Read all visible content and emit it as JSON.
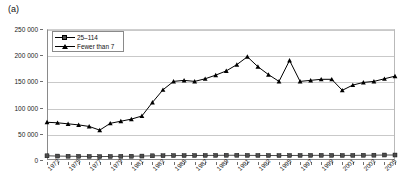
{
  "panel": {
    "label": "(a)"
  },
  "chart_data": {
    "type": "line",
    "title": "",
    "xlabel": "",
    "ylabel": "",
    "ylim": [
      0,
      250000
    ],
    "xlim": [
      1973,
      2006
    ],
    "grid": true,
    "legend_position": "top-left",
    "ytick_labels": [
      "0",
      "50 000",
      "100 000",
      "150 000",
      "200 000",
      "250 000"
    ],
    "ytick_values": [
      0,
      50000,
      100000,
      150000,
      200000,
      250000
    ],
    "x": [
      1973,
      1974,
      1975,
      1976,
      1977,
      1978,
      1979,
      1980,
      1981,
      1982,
      1983,
      1984,
      1985,
      1986,
      1987,
      1988,
      1989,
      1990,
      1991,
      1992,
      1993,
      1994,
      1995,
      1996,
      1997,
      1998,
      1999,
      2000,
      2001,
      2002,
      2003,
      2004,
      2005,
      2006
    ],
    "xtick_labels": [
      "1973",
      "1975",
      "1977",
      "1979",
      "1981",
      "1983",
      "1985",
      "1987",
      "1989",
      "1991",
      "1993",
      "1995",
      "1997",
      "1999",
      "2001",
      "2003",
      "2005"
    ],
    "xtick_values": [
      1973,
      1975,
      1977,
      1979,
      1981,
      1983,
      1985,
      1987,
      1989,
      1991,
      1993,
      1995,
      1997,
      1999,
      2001,
      2003,
      2005
    ],
    "series": [
      {
        "name": "25–114",
        "marker": "square",
        "color": "#4c4c4c",
        "values": [
          8000,
          7500,
          7200,
          7000,
          6800,
          6500,
          6800,
          7000,
          7200,
          7500,
          8000,
          8200,
          8500,
          8500,
          8600,
          8700,
          8800,
          9000,
          9000,
          8800,
          8700,
          8600,
          8500,
          8600,
          8700,
          8800,
          8900,
          8800,
          8700,
          8800,
          9000,
          9200,
          9500,
          9500
        ]
      },
      {
        "name": "Fewer than 7",
        "marker": "triangle",
        "color": "#000000",
        "values": [
          72000,
          71000,
          69000,
          67000,
          64000,
          57000,
          70000,
          74000,
          78000,
          84000,
          110000,
          134000,
          150000,
          152000,
          150000,
          155000,
          162000,
          170000,
          182000,
          197000,
          178000,
          163000,
          150000,
          190000,
          150000,
          152000,
          154000,
          154000,
          133000,
          143000,
          148000,
          150000,
          155000,
          160000
        ]
      }
    ]
  }
}
